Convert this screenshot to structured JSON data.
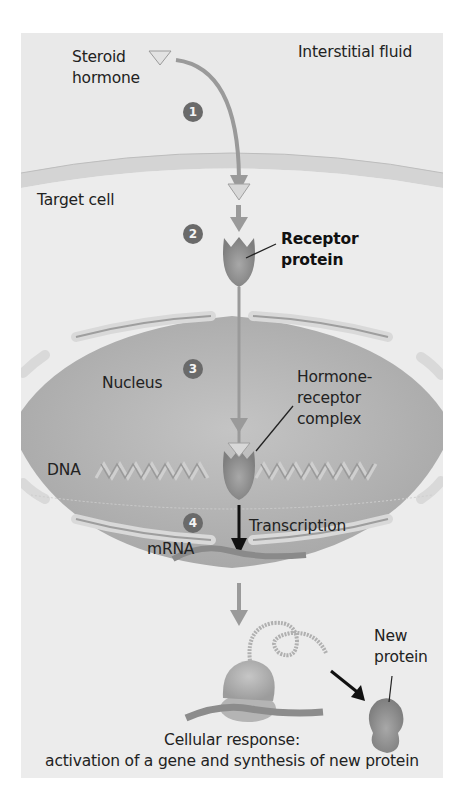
{
  "figure": {
    "regions": {
      "interstitial_fluid": "Interstitial fluid",
      "target_cell": "Target cell",
      "nucleus": "Nucleus"
    },
    "labels": {
      "steroid_hormone_line1": "Steroid",
      "steroid_hormone_line2": "hormone",
      "receptor_protein_line1": "Receptor",
      "receptor_protein_line2": "protein",
      "hormone_receptor_line1": "Hormone-",
      "hormone_receptor_line2": "receptor",
      "hormone_receptor_line3": "complex",
      "dna": "DNA",
      "transcription": "Transcription",
      "mrna": "mRNA",
      "new_protein_line1": "New",
      "new_protein_line2": "protein"
    },
    "steps": [
      "1",
      "2",
      "3",
      "4"
    ],
    "caption_line1": "Cellular response:",
    "caption_line2": "activation of a gene and synthesis of new protein",
    "colors": {
      "panel_bg": "#e9e9e9",
      "membrane": "#d2d2d2",
      "nucleus_fill": "#b4b4b4",
      "arrow_gray": "#9a9a9a",
      "badge": "#6a6a6a",
      "text": "#222222"
    }
  }
}
